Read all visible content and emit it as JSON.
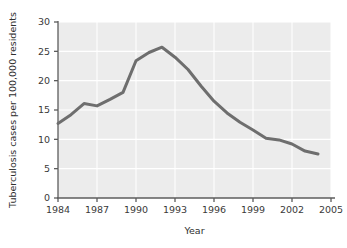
{
  "chart_data": {
    "type": "line",
    "title": "",
    "subtitle": "",
    "xlabel": "Year",
    "ylabel": "Tuberculosis cases per 100,000 residents",
    "xlim": [
      1984,
      2005
    ],
    "ylim": [
      0,
      30
    ],
    "xticks": [
      1984,
      1987,
      1990,
      1993,
      1996,
      1999,
      2002,
      2005
    ],
    "xtick_labels": [
      "1984",
      "1987",
      "1990",
      "1993",
      "1996",
      "1999",
      "2002",
      "2005"
    ],
    "yticks": [
      0,
      5,
      10,
      15,
      20,
      25,
      30
    ],
    "ytick_labels": [
      "0",
      "5",
      "10",
      "15",
      "20",
      "25",
      "30"
    ],
    "grid": true,
    "grid_color": "#ffffff",
    "plot_background": "#ececec",
    "legend": null,
    "legend_position": "none",
    "series": [
      {
        "name": "Tuberculosis cases per 100,000 residents",
        "color": "#6e6e6e",
        "line_width": 3,
        "x": [
          1984,
          1985,
          1986,
          1987,
          1988,
          1989,
          1990,
          1991,
          1992,
          1993,
          1994,
          1995,
          1996,
          1997,
          1998,
          1999,
          2000,
          2001,
          2002,
          2003,
          2004
        ],
        "values": [
          12.7,
          14.2,
          16.1,
          15.7,
          16.8,
          18.0,
          23.4,
          24.8,
          25.7,
          24.0,
          21.9,
          19.1,
          16.5,
          14.5,
          12.9,
          11.6,
          10.2,
          9.9,
          9.2,
          8.0,
          7.5
        ]
      }
    ]
  },
  "axis": {
    "x_title": "Year",
    "y_title": "Tuberculosis cases per 100,000 residents"
  }
}
